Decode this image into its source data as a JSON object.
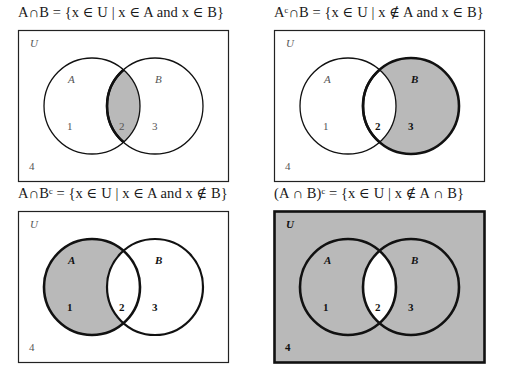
{
  "panels": [
    {
      "id": "a-intersect-b",
      "caption": "A∩B = {x ∈ U | x ∈ A and x ∈ B}",
      "shaded_regions": [
        "2"
      ],
      "universe_label": "U",
      "set_labels": {
        "A": "A",
        "B": "B"
      },
      "region_labels": {
        "r1": "1",
        "r2": "2",
        "r3": "3",
        "r4": "4"
      }
    },
    {
      "id": "a-complement-intersect-b",
      "caption": "Aᶜ∩B = {x ∈ U | x ∉ A and x ∈ B}",
      "shaded_regions": [
        "3"
      ],
      "universe_label": "U",
      "set_labels": {
        "A": "A",
        "B": "B"
      },
      "region_labels": {
        "r1": "1",
        "r2": "2",
        "r3": "3",
        "r4": "4"
      }
    },
    {
      "id": "a-intersect-b-complement",
      "caption": "A∩Bᶜ = {x ∈ U | x ∈ A and x ∉ B}",
      "shaded_regions": [
        "1"
      ],
      "universe_label": "U",
      "set_labels": {
        "A": "A",
        "B": "B"
      },
      "region_labels": {
        "r1": "1",
        "r2": "2",
        "r3": "3",
        "r4": "4"
      }
    },
    {
      "id": "a-intersect-b-all-complement",
      "caption": "(A ∩ B)ᶜ = {x ∈ U | x ∉ A ∩ B}",
      "shaded_regions": [
        "1",
        "3",
        "4"
      ],
      "universe_label": "U",
      "set_labels": {
        "A": "A",
        "B": "B"
      },
      "region_labels": {
        "r1": "1",
        "r2": "2",
        "r3": "3",
        "r4": "4"
      }
    }
  ],
  "colors": {
    "shade": "#b9b9b9",
    "stroke": "#111111",
    "background": "#ffffff"
  }
}
